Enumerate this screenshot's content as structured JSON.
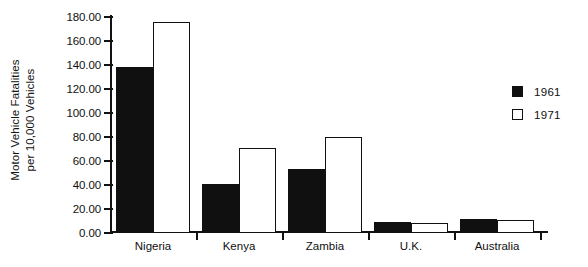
{
  "chart_data": {
    "type": "bar",
    "title": "",
    "xlabel": "",
    "ylabel": "Motor Vehicle Fatalities per 10,000 Vehicles",
    "ylabel_lines": [
      "Motor Vehicle Fatalities",
      "per 10,000 Vehicles"
    ],
    "categories": [
      "Nigeria",
      "Kenya",
      "Zambia",
      "U.K.",
      "Australia"
    ],
    "series": [
      {
        "name": "1961",
        "values": [
          138,
          41,
          53,
          9,
          12
        ],
        "color": "#101010",
        "style": "filled"
      },
      {
        "name": "1971",
        "values": [
          176,
          71,
          80,
          8,
          11
        ],
        "color": "#ffffff",
        "style": "open"
      }
    ],
    "ylim": [
      0,
      180
    ],
    "ytick_step": 20,
    "ytick_labels": [
      "0.00",
      "20.00",
      "40.00",
      "60.00",
      "80.00",
      "100.00",
      "120.00",
      "140.00",
      "160.00",
      "180.00"
    ],
    "ytick_values": [
      0,
      20,
      40,
      60,
      80,
      100,
      120,
      140,
      160,
      180
    ],
    "grid": false,
    "legend_position": "right"
  },
  "legend": {
    "entries": [
      {
        "label": "1961",
        "style": "filled"
      },
      {
        "label": "1971",
        "style": "open"
      }
    ]
  }
}
